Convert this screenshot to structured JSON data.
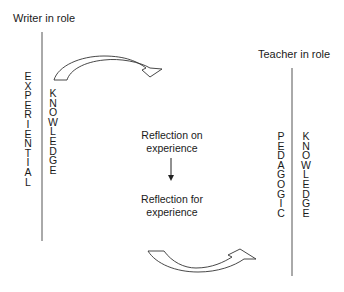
{
  "diagram": {
    "left_role": "Writer in role",
    "right_role": "Teacher in role",
    "left_columns": {
      "outer": "EXPERIENTIAL",
      "inner": "KNOWLEDGE"
    },
    "right_columns": {
      "outer": "PEDAGOGIC",
      "inner": "KNOWLEDGE"
    },
    "center_top": {
      "line1": "Reflection on",
      "line2": "experience"
    },
    "center_bottom": {
      "line1": "Reflection for",
      "line2": "experience"
    },
    "colors": {
      "text": "#1a1a1a",
      "line": "#444444",
      "background": "#ffffff"
    }
  }
}
